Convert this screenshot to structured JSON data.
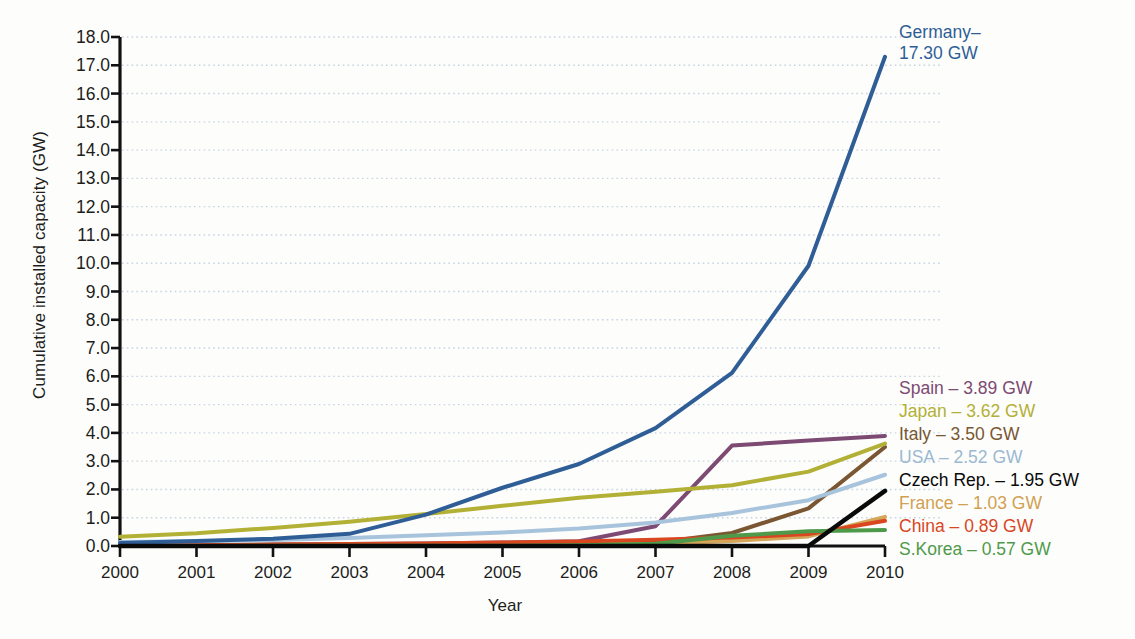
{
  "chart_data": {
    "type": "line",
    "title": "",
    "xlabel": "Year",
    "ylabel": "Cumulative installed capacity (GW)",
    "xlim": [
      2000,
      2010
    ],
    "ylim": [
      0.0,
      18.0
    ],
    "grid": true,
    "legend_position": "right-inline-annotations",
    "x": [
      2000,
      2001,
      2002,
      2003,
      2004,
      2005,
      2006,
      2007,
      2008,
      2009,
      2010
    ],
    "xticklabels": [
      "2000",
      "2001",
      "2002",
      "2003",
      "2004",
      "2005",
      "2006",
      "2007",
      "2008",
      "2009",
      "2010"
    ],
    "yticklabels": [
      "0.0",
      "1.0",
      "2.0",
      "3.0",
      "4.0",
      "5.0",
      "6.0",
      "7.0",
      "8.0",
      "9.0",
      "10.0",
      "11.0",
      "12.0",
      "13.0",
      "14.0",
      "15.0",
      "16.0",
      "17.0",
      "18.0"
    ],
    "series": [
      {
        "name": "Germany",
        "label": "Germany–",
        "label_line2": "17.30 GW",
        "final_value": 17.3,
        "color": "#2f5d96",
        "width": 4.0,
        "values": [
          0.11,
          0.18,
          0.26,
          0.43,
          1.11,
          2.06,
          2.9,
          4.17,
          6.12,
          9.91,
          17.3
        ]
      },
      {
        "name": "Spain",
        "label": "Spain – 3.89 GW",
        "final_value": 3.89,
        "color": "#7c4a72",
        "width": 4.0,
        "values": [
          0.02,
          0.03,
          0.05,
          0.07,
          0.09,
          0.12,
          0.17,
          0.7,
          3.55,
          3.73,
          3.89
        ]
      },
      {
        "name": "Japan",
        "label": "Japan – 3.62 GW",
        "final_value": 3.62,
        "color": "#b3b036",
        "width": 4.0,
        "values": [
          0.33,
          0.45,
          0.64,
          0.86,
          1.13,
          1.42,
          1.71,
          1.92,
          2.15,
          2.63,
          3.62
        ]
      },
      {
        "name": "Italy",
        "label": "Italy – 3.50 GW",
        "final_value": 3.5,
        "color": "#7a5632",
        "width": 4.0,
        "values": [
          0.02,
          0.02,
          0.02,
          0.03,
          0.03,
          0.04,
          0.05,
          0.12,
          0.46,
          1.33,
          3.5
        ]
      },
      {
        "name": "USA",
        "label": "USA – 2.52 GW",
        "final_value": 2.52,
        "color": "#a7c4dc",
        "width": 4.0,
        "values": [
          0.14,
          0.17,
          0.21,
          0.28,
          0.38,
          0.48,
          0.62,
          0.83,
          1.17,
          1.62,
          2.52
        ]
      },
      {
        "name": "Czech Rep.",
        "label": "Czech Rep. – 1.95 GW",
        "final_value": 1.95,
        "color": "#0a0a0a",
        "width": 4.5,
        "values": [
          0.0,
          0.0,
          0.0,
          0.0,
          0.0,
          0.0,
          0.0,
          0.0,
          0.0,
          0.0,
          1.95
        ]
      },
      {
        "name": "France",
        "label": "France – 1.03 GW",
        "final_value": 1.03,
        "color": "#d4a659",
        "width": 4.0,
        "values": [
          0.01,
          0.01,
          0.01,
          0.02,
          0.02,
          0.03,
          0.04,
          0.08,
          0.18,
          0.34,
          1.03
        ]
      },
      {
        "name": "China",
        "label": "China – 0.89 GW",
        "final_value": 0.89,
        "color": "#d9461f",
        "width": 4.0,
        "values": [
          0.02,
          0.03,
          0.05,
          0.07,
          0.09,
          0.12,
          0.16,
          0.22,
          0.3,
          0.42,
          0.89
        ]
      },
      {
        "name": "S.Korea",
        "label": "S.Korea – 0.57 GW",
        "final_value": 0.57,
        "color": "#4f9a4a",
        "width": 4.0,
        "values": [
          0.0,
          0.0,
          0.01,
          0.01,
          0.01,
          0.01,
          0.03,
          0.08,
          0.36,
          0.52,
          0.57
        ]
      }
    ]
  }
}
